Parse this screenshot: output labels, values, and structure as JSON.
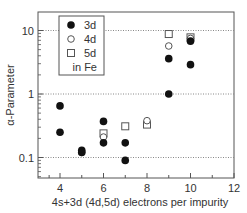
{
  "chart_data": {
    "type": "scatter",
    "title": "",
    "xlabel": "4s+3d (4d,5d) electrons per impurity",
    "ylabel": "α-Parameter",
    "xlim": [
      3,
      12
    ],
    "ylim": [
      0.05,
      20
    ],
    "yscale": "log",
    "x_ticks": [
      4,
      6,
      8,
      10,
      12
    ],
    "y_ticks": [
      0.1,
      1,
      10
    ],
    "y_tick_labels": [
      "0.1",
      "1",
      "10"
    ],
    "grid": "horizontal dotted at y ticks",
    "legend_position": "upper left",
    "legend_note": "in Fe",
    "series": [
      {
        "name": "3d",
        "marker": "filled-circle",
        "points": [
          [
            4,
            0.65
          ],
          [
            4,
            0.25
          ],
          [
            5,
            0.13
          ],
          [
            5,
            0.12
          ],
          [
            6,
            0.37
          ],
          [
            6,
            0.17
          ],
          [
            7,
            0.17
          ],
          [
            7,
            0.09
          ],
          [
            9,
            3.6
          ],
          [
            9,
            1.0
          ],
          [
            10,
            6.8
          ],
          [
            10,
            2.9
          ]
        ]
      },
      {
        "name": "4d",
        "marker": "open-circle",
        "points": [
          [
            5,
            0.12
          ],
          [
            6,
            0.21
          ],
          [
            8,
            0.38
          ],
          [
            9,
            5.7
          ],
          [
            10,
            7.5
          ]
        ]
      },
      {
        "name": "5d",
        "marker": "open-square",
        "points": [
          [
            6,
            0.24
          ],
          [
            7,
            0.31
          ],
          [
            8,
            0.33
          ],
          [
            9,
            8.8
          ],
          [
            10,
            7.8
          ]
        ]
      }
    ]
  },
  "legend": {
    "items": [
      {
        "label": "3d",
        "icon": "filled-circle-icon"
      },
      {
        "label": "4d",
        "icon": "open-circle-icon"
      },
      {
        "label": "5d",
        "icon": "open-square-icon"
      }
    ],
    "note": "in Fe"
  },
  "axes": {
    "xlabel": "4s+3d (4d,5d) electrons per impurity",
    "ylabel": "α-Parameter"
  }
}
